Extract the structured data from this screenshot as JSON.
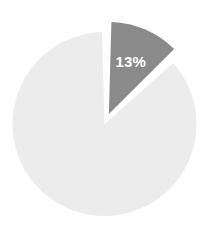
{
  "chart_data": {
    "type": "pie",
    "title": "",
    "subtitle": "",
    "xlabel": "",
    "ylabel": "",
    "grid": false,
    "legend": "none",
    "exploded": true,
    "exploded_index": 0,
    "units": "percent",
    "categories": [
      "Highlighted segment",
      "Remainder"
    ],
    "values": [
      13,
      87
    ],
    "labels": [
      "13%",
      ""
    ],
    "colors": [
      "#8a8a8a",
      "#ececec"
    ],
    "label_colors": [
      "#ffffff",
      "#ffffff"
    ],
    "slices": [
      {
        "name": "Highlighted segment",
        "value": 13,
        "label": "13%",
        "color": "#8a8a8a",
        "label_color": "#ffffff",
        "exploded": true,
        "start_angle_deg": 0,
        "end_angle_deg": 46.8
      },
      {
        "name": "Remainder",
        "value": 87,
        "label": "",
        "color": "#ececec",
        "label_color": "#ffffff",
        "exploded": false,
        "start_angle_deg": 46.8,
        "end_angle_deg": 360
      }
    ]
  },
  "figure": {
    "background_color": "#ffffff",
    "gap_color": "#ffffff"
  }
}
